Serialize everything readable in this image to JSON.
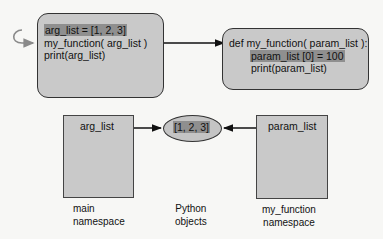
{
  "caller_box": {
    "lines": [
      "arg_list = [1, 2, 3]",
      "my_function( arg_list )",
      "print(arg_list)"
    ],
    "highlighted_line": 0
  },
  "function_box": {
    "lines": [
      "def my_function( param_list ):",
      "param_list [0] = 100",
      "print(param_list)"
    ],
    "highlighted_line": 1
  },
  "main_namespace": {
    "variable": "arg_list",
    "caption_line1": "main",
    "caption_line2": "namespace"
  },
  "python_objects": {
    "value": "[1, 2, 3]",
    "caption_line1": "Python",
    "caption_line2": "objects"
  },
  "function_namespace": {
    "variable": "param_list",
    "caption_line1": "my_function",
    "caption_line2": "namespace"
  },
  "colors": {
    "box_fill": "#c9c9c9",
    "highlight": "#8f8f8f",
    "border": "#333333",
    "loop_arrow": "#8a8a8a"
  }
}
